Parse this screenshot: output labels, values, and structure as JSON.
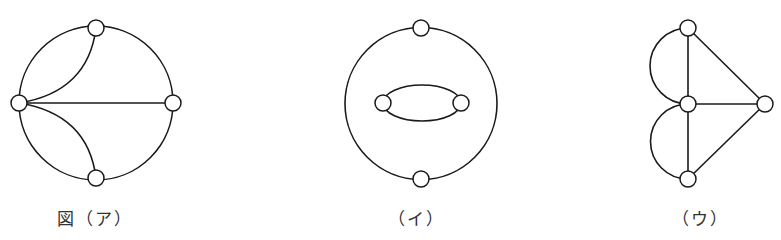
{
  "figures": [
    {
      "id": "a",
      "caption": "図（ア）",
      "nodes": [
        {
          "name": "top",
          "x": 96,
          "y": 28
        },
        {
          "name": "left",
          "x": 19,
          "y": 103
        },
        {
          "name": "right",
          "x": 173,
          "y": 103
        },
        {
          "name": "bottom",
          "x": 96,
          "y": 178
        }
      ],
      "edges": [
        {
          "from": "top",
          "to": "right",
          "shape": "outer-arc"
        },
        {
          "from": "right",
          "to": "bottom",
          "shape": "outer-arc"
        },
        {
          "from": "bottom",
          "to": "left",
          "shape": "outer-arc"
        },
        {
          "from": "left",
          "to": "top",
          "shape": "outer-arc"
        },
        {
          "from": "left",
          "to": "top",
          "shape": "inner-curve"
        },
        {
          "from": "left",
          "to": "bottom",
          "shape": "inner-curve"
        },
        {
          "from": "left",
          "to": "right",
          "shape": "straight"
        }
      ]
    },
    {
      "id": "i",
      "caption": "（イ）",
      "nodes": [
        {
          "name": "top",
          "x": 421,
          "y": 28
        },
        {
          "name": "bottom",
          "x": 421,
          "y": 179
        },
        {
          "name": "inner-left",
          "x": 383,
          "y": 103
        },
        {
          "name": "inner-right",
          "x": 461,
          "y": 103
        }
      ],
      "edges": [
        {
          "from": "top",
          "to": "bottom",
          "shape": "outer-arc-right"
        },
        {
          "from": "bottom",
          "to": "top",
          "shape": "outer-arc-left"
        },
        {
          "from": "inner-left",
          "to": "inner-right",
          "shape": "upper-curve"
        },
        {
          "from": "inner-right",
          "to": "inner-left",
          "shape": "lower-curve"
        }
      ]
    },
    {
      "id": "u",
      "caption": "（ウ）",
      "nodes": [
        {
          "name": "top",
          "x": 688,
          "y": 28
        },
        {
          "name": "middle",
          "x": 688,
          "y": 104
        },
        {
          "name": "bottom",
          "x": 688,
          "y": 179
        },
        {
          "name": "right",
          "x": 765,
          "y": 104
        }
      ],
      "edges": [
        {
          "from": "top",
          "to": "middle",
          "shape": "straight"
        },
        {
          "from": "middle",
          "to": "bottom",
          "shape": "straight"
        },
        {
          "from": "top",
          "to": "middle",
          "shape": "left-semicircle"
        },
        {
          "from": "middle",
          "to": "bottom",
          "shape": "left-semicircle"
        },
        {
          "from": "top",
          "to": "right",
          "shape": "straight"
        },
        {
          "from": "middle",
          "to": "right",
          "shape": "straight"
        },
        {
          "from": "bottom",
          "to": "right",
          "shape": "straight"
        }
      ]
    }
  ]
}
